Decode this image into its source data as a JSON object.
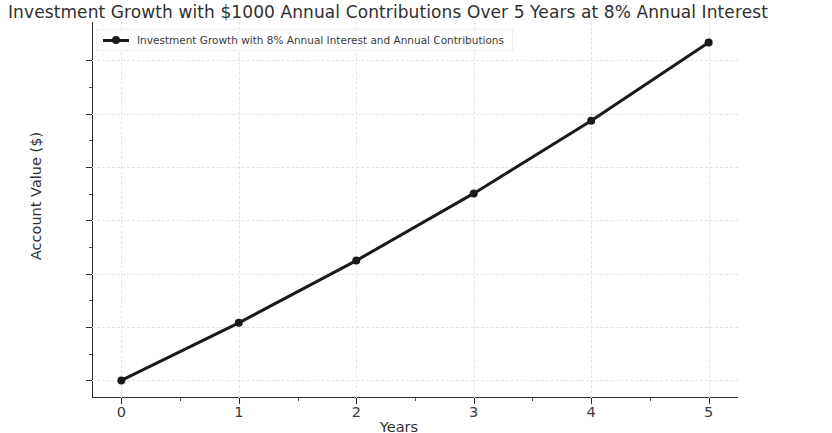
{
  "chart_data": {
    "type": "line",
    "title": "Investment Growth with $1000 Annual Contributions Over 5 Years at 8% Annual Interest",
    "xlabel": "Years",
    "ylabel": "Account Value ($)",
    "x": [
      0,
      1,
      2,
      3,
      4,
      5
    ],
    "xtick_labels": [
      "0",
      "1",
      "2",
      "3",
      "4",
      "5"
    ],
    "ytick_labels": [
      "0",
      "1000",
      "2000",
      "3000",
      "4000",
      "5000",
      "6000"
    ],
    "ytick_values": [
      0,
      1000,
      2000,
      3000,
      4000,
      5000,
      6000
    ],
    "xlim": [
      -0.25,
      5.25
    ],
    "ylim": [
      -330,
      6720
    ],
    "grid": true,
    "grid_style": "dashed",
    "grid_color": "#e3e3e6",
    "legend_position": "upper left",
    "line_color": "#1a1a1a",
    "line_width": 3,
    "marker": "circle",
    "series": [
      {
        "name": "Investment Growth with 8% Annual Interest and Annual Contributions",
        "values": [
          0,
          1080,
          2246,
          3506,
          4867,
          6336
        ]
      }
    ]
  },
  "legend": {
    "entries": [
      {
        "label": "Investment Growth with 8% Annual Interest and Annual Contributions"
      }
    ]
  }
}
